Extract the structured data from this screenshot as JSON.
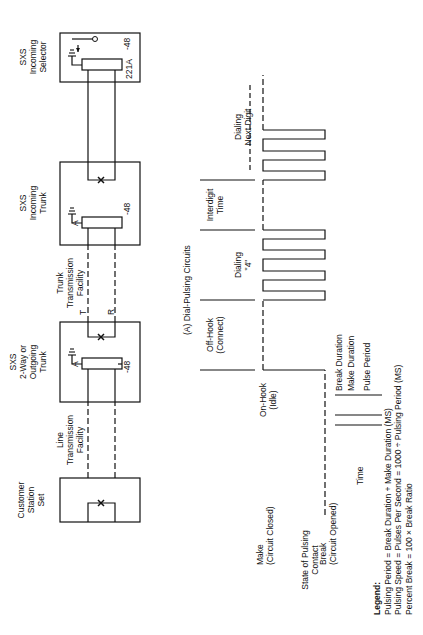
{
  "figure": {
    "caption": "(A) Dial-Pulsing Circuits",
    "orientation": "rotated 90° counter-clockwise"
  },
  "circuit": {
    "blocks": [
      {
        "id": "customer",
        "label": [
          "Customer",
          "Station",
          "Set"
        ]
      },
      {
        "id": "two-way",
        "label": [
          "SXS",
          "2-Way or",
          "Outgoing",
          "Trunk"
        ],
        "relay": "A",
        "voltage": "-48"
      },
      {
        "id": "incoming-trunk",
        "label": [
          "SXS",
          "Incoming",
          "Trunk"
        ],
        "relay": "A",
        "voltage": "-48"
      },
      {
        "id": "selector",
        "label": [
          "SXS",
          "Incoming",
          "Selector"
        ],
        "relay": "221A",
        "voltage": "-48"
      }
    ],
    "facilities": [
      {
        "id": "line",
        "label": [
          "Line",
          "Transmission",
          "Facility"
        ]
      },
      {
        "id": "trunk",
        "label": [
          "Trunk",
          "Transmission",
          "Facility"
        ],
        "tip": "T",
        "ring": "R"
      }
    ]
  },
  "timing": {
    "intervals": [
      {
        "label": [
          "On-Hook",
          "(Idle)"
        ]
      },
      {
        "label": [
          "Off-Hook",
          "(Connect)"
        ]
      },
      {
        "label": [
          "Dialing",
          "\"4\""
        ]
      },
      {
        "label": [
          "Interdigit",
          "Time"
        ]
      },
      {
        "label": [
          "Dialing",
          "Next Digit"
        ]
      }
    ],
    "states": {
      "make": [
        "Make",
        "(Circuit Closed)"
      ],
      "break": [
        "Break",
        "(Circuit Opened)"
      ],
      "axis_title": [
        "State of Pulsing",
        "Contact"
      ]
    },
    "time_label": "Time",
    "pulse_annotations": [
      "Break Duration",
      "Make Duration",
      "Pulse Period"
    ]
  },
  "legend": {
    "title": "Legend:",
    "lines": [
      "Pulsing Period = Break Duration + Make Duration (MS)",
      "Pulsing Speed = Pulses Per Second = 1000 ÷ Pulsing Period (MS)",
      "Percent Break = 100 × Break Ratio"
    ]
  }
}
